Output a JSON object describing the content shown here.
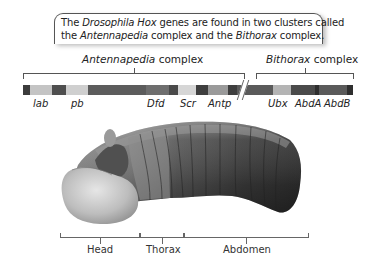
{
  "callout": {
    "line1": {
      "a": "The ",
      "b": "Drosophila Hox",
      "c": " genes are found in two clusters called"
    },
    "line2": {
      "a": "the ",
      "b": "Antennapedia",
      "c": " complex and the ",
      "d": "Bithorax",
      "e": " complex."
    }
  },
  "complexes": [
    {
      "name": "Antennapedia",
      "suffix": " complex"
    },
    {
      "name": "Bithorax",
      "suffix": " complex"
    }
  ],
  "genes": [
    {
      "label": "lab"
    },
    {
      "label": "pb"
    },
    {
      "label": "Dfd"
    },
    {
      "label": "Scr"
    },
    {
      "label": "Antp"
    },
    {
      "label": "Ubx"
    },
    {
      "label": "AbdA"
    },
    {
      "label": "AbdB"
    }
  ],
  "regions": [
    {
      "label": "Head"
    },
    {
      "label": "Thorax"
    },
    {
      "label": "Abdomen"
    }
  ],
  "colors": {
    "darkest": "#3c3c3c",
    "dark": "#555555",
    "mid": "#7a7a7a",
    "light": "#b8b8b8",
    "lighter": "#d2d2d2"
  }
}
